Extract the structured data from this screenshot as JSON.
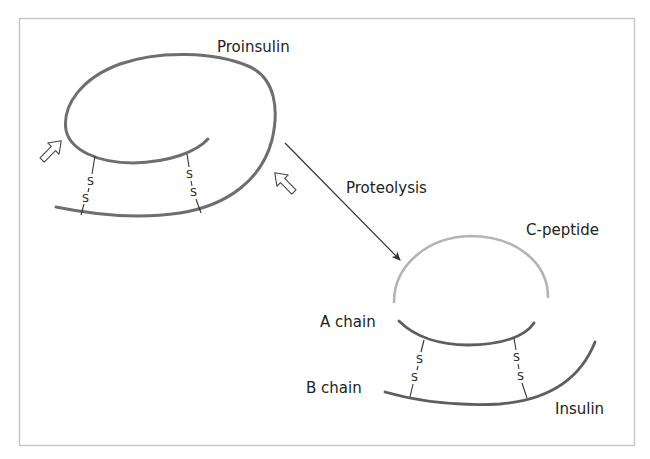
{
  "figure": {
    "labels": {
      "proinsulin": "Proinsulin",
      "proteolysis": "Proteolysis",
      "c_peptide": "C-peptide",
      "a_chain": "A chain",
      "b_chain": "B chain",
      "insulin": "Insulin"
    },
    "disulfide": {
      "atom_top": "S",
      "atom_bottom": "S"
    },
    "colors": {
      "chain": "#6e6e6e",
      "c_peptide": "#b4b4b4",
      "frame": "#c8c8c8",
      "bond": "#333333",
      "arrow": "#333333",
      "text": "#222222"
    },
    "cleavage_site_count": 2,
    "disulfide_bond_count": 2
  }
}
